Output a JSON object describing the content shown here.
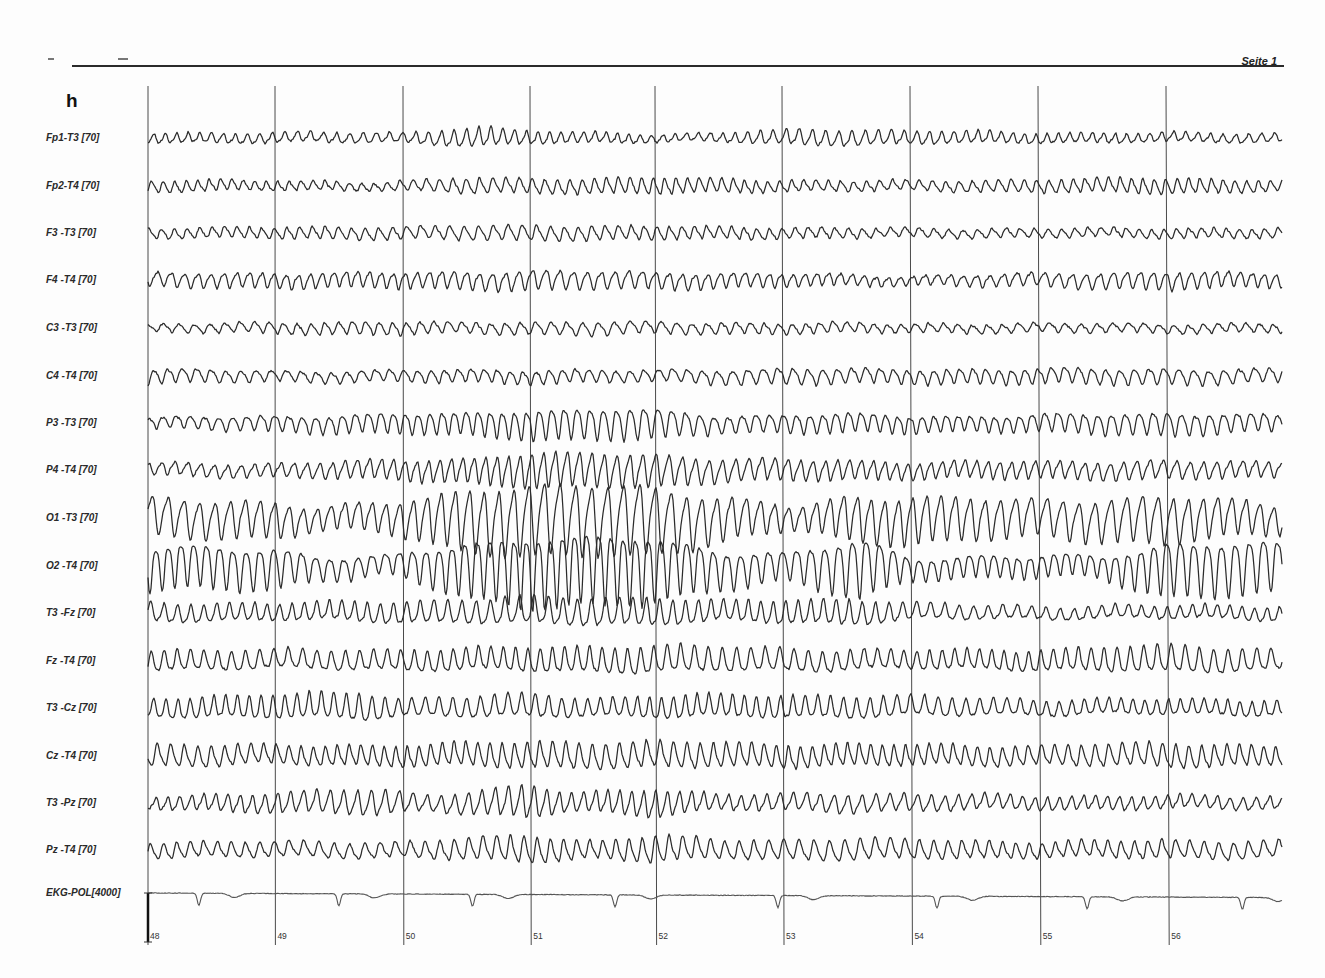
{
  "document": {
    "panel_letter": "h",
    "page_label": "Seite 1",
    "ink_color": "#2b2b2b",
    "grid_color": "#4a4a4a"
  },
  "chart_data": {
    "type": "line",
    "xlabel": "Time (s)",
    "ylabel": "",
    "x_ticks": [
      48,
      49,
      50,
      51,
      52,
      53,
      54,
      55,
      56
    ],
    "x_tick_px": [
      148,
      275,
      403,
      530,
      655,
      782,
      910,
      1038,
      1166
    ],
    "x_range_px": [
      148,
      1282
    ],
    "grid": "vertical lines at each second",
    "legend": "none",
    "channels": [
      {
        "label": "Fp1-T3 [70]",
        "y": 138,
        "base_amp": 5,
        "freq": 9.5,
        "envelope": [
          [
            48,
            0.9
          ],
          [
            50,
            0.9
          ],
          [
            50.6,
            1.8
          ],
          [
            51,
            1.2
          ],
          [
            52.2,
            0.6
          ],
          [
            53.2,
            1.5
          ],
          [
            54,
            1.2
          ],
          [
            55,
            0.9
          ],
          [
            56.9,
            0.8
          ]
        ]
      },
      {
        "label": "Fp2-T4 [70]",
        "y": 186,
        "base_amp": 5,
        "freq": 9.5,
        "envelope": [
          [
            48,
            1.1
          ],
          [
            49.8,
            0.7
          ],
          [
            50.5,
            1.4
          ],
          [
            51.2,
            1.3
          ],
          [
            52,
            1.5
          ],
          [
            53,
            1.0
          ],
          [
            54,
            0.9
          ],
          [
            56,
            1.4
          ],
          [
            56.9,
            1.0
          ]
        ]
      },
      {
        "label": "F3 -T3 [70]",
        "y": 233,
        "base_amp": 5,
        "freq": 9.5,
        "envelope": [
          [
            48,
            0.9
          ],
          [
            50.3,
            1.2
          ],
          [
            51,
            1.4
          ],
          [
            52,
            1.2
          ],
          [
            53,
            1.0
          ],
          [
            54,
            0.8
          ],
          [
            55,
            0.8
          ],
          [
            56.9,
            0.9
          ]
        ]
      },
      {
        "label": "F4 -T4 [70]",
        "y": 280,
        "base_amp": 6,
        "freq": 9.5,
        "envelope": [
          [
            48,
            1.1
          ],
          [
            50,
            1.2
          ],
          [
            51,
            1.5
          ],
          [
            52,
            1.3
          ],
          [
            53,
            1.0
          ],
          [
            54,
            0.7
          ],
          [
            56,
            1.4
          ],
          [
            56.9,
            1.0
          ]
        ]
      },
      {
        "label": "C3 -T3 [70]",
        "y": 328,
        "base_amp": 5,
        "freq": 9.5,
        "envelope": [
          [
            48,
            0.7
          ],
          [
            49.8,
            1.2
          ],
          [
            50.5,
            1.0
          ],
          [
            51.5,
            1.2
          ],
          [
            52.2,
            1.0
          ],
          [
            53,
            1.0
          ],
          [
            54,
            0.8
          ],
          [
            56.9,
            0.8
          ]
        ]
      },
      {
        "label": "C4 -T4 [70]",
        "y": 376,
        "base_amp": 6,
        "freq": 9.5,
        "envelope": [
          [
            48,
            1.1
          ],
          [
            49,
            0.8
          ],
          [
            50,
            0.9
          ],
          [
            51,
            1.0
          ],
          [
            52,
            0.9
          ],
          [
            53,
            1.2
          ],
          [
            54,
            1.1
          ],
          [
            56,
            1.2
          ],
          [
            56.9,
            1.0
          ]
        ]
      },
      {
        "label": "P3 -T3 [70]",
        "y": 423,
        "base_amp": 7,
        "freq": 9.5,
        "envelope": [
          [
            48,
            0.7
          ],
          [
            49.8,
            1.3
          ],
          [
            50.5,
            1.5
          ],
          [
            51,
            2.0
          ],
          [
            51.9,
            2.1
          ],
          [
            52.5,
            1.1
          ],
          [
            53.5,
            1.3
          ],
          [
            54.5,
            1.0
          ],
          [
            56,
            1.5
          ],
          [
            56.9,
            1.1
          ]
        ]
      },
      {
        "label": "P4 -T4 [70]",
        "y": 470,
        "base_amp": 7,
        "freq": 9.5,
        "envelope": [
          [
            48,
            0.8
          ],
          [
            49,
            0.9
          ],
          [
            50.5,
            1.6
          ],
          [
            51,
            2.3
          ],
          [
            51.9,
            2.2
          ],
          [
            52.5,
            1.5
          ],
          [
            53.5,
            1.3
          ],
          [
            54,
            1.1
          ],
          [
            56,
            1.2
          ],
          [
            56.9,
            1.0
          ]
        ]
      },
      {
        "label": "O1 -T3 [70]",
        "y": 518,
        "base_amp": 13,
        "freq": 9.5,
        "envelope": [
          [
            48,
            1.4
          ],
          [
            49,
            1.3
          ],
          [
            49.3,
            0.8
          ],
          [
            49.9,
            1.1
          ],
          [
            50.5,
            2.2
          ],
          [
            51,
            2.5
          ],
          [
            51.9,
            2.5
          ],
          [
            52.5,
            1.6
          ],
          [
            53.1,
            0.8
          ],
          [
            53.5,
            1.6
          ],
          [
            54,
            1.7
          ],
          [
            55,
            1.3
          ],
          [
            56,
            1.7
          ],
          [
            56.9,
            1.0
          ]
        ]
      },
      {
        "label": "O2 -T4 [70]",
        "y": 566,
        "base_amp": 13,
        "freq": 9.5,
        "envelope": [
          [
            48,
            1.6
          ],
          [
            49,
            1.5
          ],
          [
            49.3,
            0.9
          ],
          [
            49.9,
            0.7
          ],
          [
            50.5,
            2.0
          ],
          [
            51,
            2.6
          ],
          [
            51.9,
            2.5
          ],
          [
            52.5,
            1.4
          ],
          [
            53,
            1.0
          ],
          [
            53.6,
            2.2
          ],
          [
            54,
            0.8
          ],
          [
            55.5,
            0.8
          ],
          [
            56,
            2.0
          ],
          [
            56.9,
            1.9
          ]
        ]
      },
      {
        "label": "T3 -Fz [70]",
        "y": 613,
        "base_amp": 8,
        "freq": 9.5,
        "envelope": [
          [
            48,
            1.1
          ],
          [
            49,
            1.0
          ],
          [
            50.4,
            1.3
          ],
          [
            51,
            1.6
          ],
          [
            52,
            1.6
          ],
          [
            52.5,
            1.2
          ],
          [
            53.5,
            1.5
          ],
          [
            54,
            1.0
          ],
          [
            55,
            0.7
          ],
          [
            56.9,
            0.8
          ]
        ]
      },
      {
        "label": "Fz -T4 [70]",
        "y": 661,
        "base_amp": 8,
        "freq": 9.5,
        "envelope": [
          [
            48,
            1.2
          ],
          [
            49,
            1.1
          ],
          [
            50,
            1.2
          ],
          [
            51,
            1.4
          ],
          [
            52,
            1.6
          ],
          [
            53,
            1.3
          ],
          [
            54,
            1.1
          ],
          [
            55,
            1.2
          ],
          [
            56,
            1.6
          ],
          [
            56.9,
            1.2
          ]
        ]
      },
      {
        "label": "T3 -Cz [70]",
        "y": 708,
        "base_amp": 8,
        "freq": 9.5,
        "envelope": [
          [
            48,
            1.1
          ],
          [
            49.7,
            1.6
          ],
          [
            50,
            1.0
          ],
          [
            51,
            1.4
          ],
          [
            51.5,
            1.0
          ],
          [
            52,
            1.3
          ],
          [
            53,
            1.3
          ],
          [
            54,
            1.2
          ],
          [
            55,
            0.9
          ],
          [
            56.9,
            0.9
          ]
        ]
      },
      {
        "label": "Cz -T4 [70]",
        "y": 756,
        "base_amp": 8,
        "freq": 9.5,
        "envelope": [
          [
            48,
            1.3
          ],
          [
            49,
            1.1
          ],
          [
            50,
            1.2
          ],
          [
            51,
            1.5
          ],
          [
            52,
            1.5
          ],
          [
            53,
            1.3
          ],
          [
            54,
            1.2
          ],
          [
            55,
            1.1
          ],
          [
            56,
            1.4
          ],
          [
            56.9,
            1.1
          ]
        ]
      },
      {
        "label": "T3 -Pz [70]",
        "y": 803,
        "base_amp": 7,
        "freq": 9.5,
        "envelope": [
          [
            48,
            0.8
          ],
          [
            49.8,
            1.7
          ],
          [
            50.2,
            1.0
          ],
          [
            51,
            2.2
          ],
          [
            51.3,
            1.2
          ],
          [
            52,
            1.8
          ],
          [
            52.5,
            1.0
          ],
          [
            53.5,
            1.2
          ],
          [
            54,
            1.1
          ],
          [
            55,
            0.9
          ],
          [
            56.9,
            0.8
          ]
        ]
      },
      {
        "label": "Pz -T4 [70]",
        "y": 850,
        "base_amp": 7,
        "freq": 9.5,
        "envelope": [
          [
            48,
            1.0
          ],
          [
            50,
            1.0
          ],
          [
            51,
            1.8
          ],
          [
            51.5,
            1.1
          ],
          [
            52,
            1.8
          ],
          [
            52.5,
            1.2
          ],
          [
            53.5,
            1.4
          ],
          [
            54,
            1.3
          ],
          [
            55,
            1.0
          ],
          [
            56,
            1.2
          ],
          [
            56.9,
            1.1
          ]
        ]
      }
    ],
    "ekg": {
      "label": "EKG-POL[4000]",
      "y": 893,
      "beats_s": [
        48.4,
        49.5,
        50.55,
        51.67,
        52.95,
        54.2,
        55.38,
        56.6
      ],
      "r_depth": 12,
      "t_dip": 4
    },
    "calibration_bar": {
      "x": 148,
      "y_top": 893,
      "y_bottom": 942
    }
  }
}
